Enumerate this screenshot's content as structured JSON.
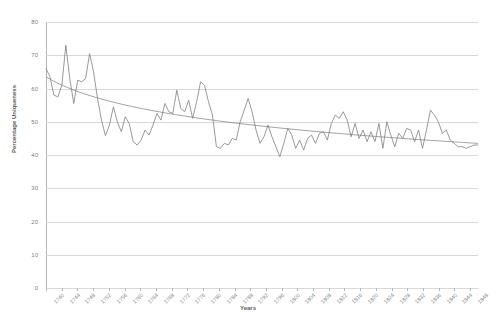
{
  "chart_data": {
    "type": "line",
    "title": "",
    "xlabel": "Years",
    "ylabel": "Percentage Uniqueness",
    "ylim": [
      0,
      80
    ],
    "ytick_step": 10,
    "yticks": [
      0,
      10,
      20,
      30,
      40,
      50,
      60,
      70,
      80
    ],
    "grid": true,
    "legend": "none",
    "xtick_labels": [
      "1740",
      "1744",
      "1748",
      "1752",
      "1756",
      "1760",
      "1764",
      "1768",
      "1772",
      "1776",
      "1780",
      "1784",
      "1788",
      "1792",
      "1796",
      "1800",
      "1804",
      "1808",
      "1812",
      "1816",
      "1820",
      "1824",
      "1828",
      "1832",
      "1836",
      "1840",
      "1844",
      "1848"
    ],
    "line_color": "#808080",
    "trend_color": "#7a7a7a",
    "grid_color": "#d9d9d9",
    "series": [
      {
        "name": "Percentage Uniqueness",
        "x": [
          1740,
          1741,
          1742,
          1743,
          1744,
          1745,
          1746,
          1747,
          1748,
          1749,
          1750,
          1751,
          1752,
          1753,
          1754,
          1755,
          1756,
          1757,
          1758,
          1759,
          1760,
          1761,
          1762,
          1763,
          1764,
          1765,
          1766,
          1767,
          1768,
          1769,
          1770,
          1771,
          1772,
          1773,
          1774,
          1775,
          1776,
          1777,
          1778,
          1779,
          1780,
          1781,
          1782,
          1783,
          1784,
          1785,
          1786,
          1787,
          1788,
          1789,
          1790,
          1791,
          1792,
          1793,
          1794,
          1795,
          1796,
          1797,
          1798,
          1799,
          1800,
          1801,
          1802,
          1803,
          1804,
          1805,
          1806,
          1807,
          1808,
          1809,
          1810,
          1811,
          1812,
          1813,
          1814,
          1815,
          1816,
          1817,
          1818,
          1819,
          1820,
          1821,
          1822,
          1823,
          1824,
          1825,
          1826,
          1827,
          1828,
          1829,
          1830,
          1831,
          1832,
          1833,
          1834,
          1835,
          1836,
          1837,
          1838,
          1839,
          1840,
          1841,
          1842,
          1843,
          1844,
          1845,
          1846,
          1847,
          1848,
          1849
        ],
        "values": [
          66.0,
          63.5,
          58.0,
          57.5,
          61.0,
          73.0,
          63.0,
          55.5,
          62.5,
          62.0,
          63.0,
          70.5,
          65.0,
          57.0,
          50.5,
          45.8,
          49.0,
          54.5,
          50.0,
          47.0,
          51.5,
          49.5,
          44.0,
          43.0,
          44.5,
          47.5,
          46.0,
          49.0,
          52.5,
          50.5,
          55.5,
          53.0,
          52.5,
          59.5,
          54.0,
          53.0,
          56.5,
          51.0,
          56.0,
          62.0,
          61.0,
          56.0,
          52.0,
          42.5,
          42.0,
          43.5,
          43.0,
          45.0,
          44.5,
          50.0,
          53.5,
          57.0,
          53.0,
          47.5,
          43.5,
          45.5,
          49.0,
          45.5,
          42.5,
          39.5,
          43.5,
          48.0,
          46.0,
          42.0,
          44.5,
          41.5,
          45.0,
          46.0,
          43.5,
          46.5,
          47.0,
          44.5,
          49.5,
          52.0,
          51.0,
          53.0,
          50.5,
          45.5,
          49.5,
          45.0,
          47.5,
          44.0,
          47.0,
          44.0,
          49.5,
          42.0,
          50.0,
          46.0,
          42.5,
          46.5,
          45.0,
          48.0,
          47.5,
          44.0,
          47.5,
          42.0,
          47.5,
          53.5,
          52.0,
          50.0,
          46.5,
          47.5,
          44.5,
          43.5,
          42.5,
          42.5,
          42.0,
          42.5,
          43.0,
          43.0
        ]
      }
    ],
    "trendline": {
      "type": "logarithmic-decay",
      "start_value": 63.5,
      "end_value": 43.5,
      "description": "smooth descending curve from about 63.5 in 1740 to about 43.5 in 1849"
    }
  }
}
